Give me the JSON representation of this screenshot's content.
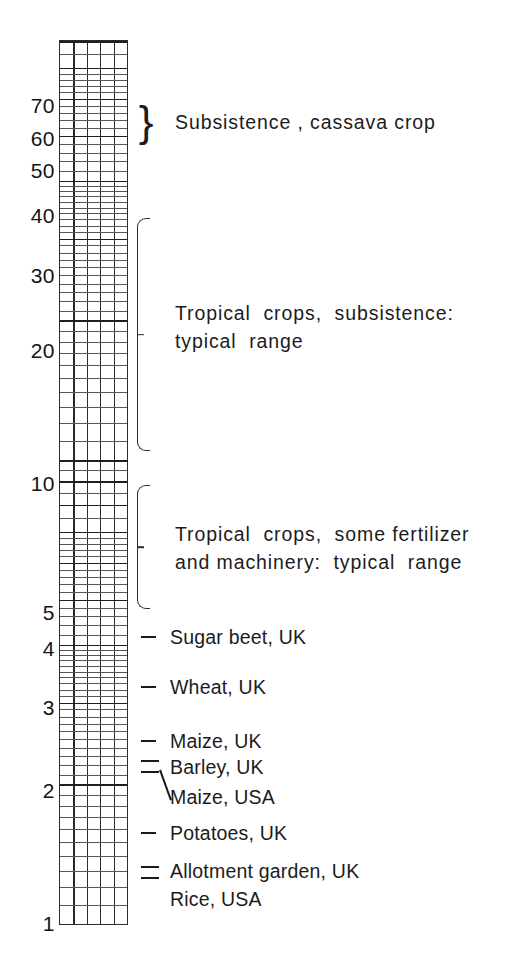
{
  "chart_data": {
    "type": "bar",
    "title": "",
    "subtitle": "",
    "xlabel": "",
    "ylabel": "",
    "scale": "log10",
    "ylim": [
      1,
      80
    ],
    "grid": true,
    "legend_position": "right",
    "axis": {
      "tick_labels": [
        "70",
        "60",
        "50",
        "40",
        "30",
        "20",
        "10",
        "5",
        "4",
        "3",
        "2",
        "1"
      ],
      "tick_values": [
        70,
        60,
        50,
        40,
        30,
        20,
        10,
        5,
        4,
        3,
        2,
        1
      ]
    },
    "ranges": [
      {
        "label": "Subsistence , cassava crop",
        "low": 55,
        "high": 72,
        "marker": "curly-brace"
      },
      {
        "label": "Tropical crops, subsistence: typical range",
        "low": 14,
        "high": 38,
        "marker": "bracket"
      },
      {
        "label": "Tropical crops, some fertilizer and machinery: typical range",
        "low": 5,
        "high": 10,
        "marker": "bracket"
      }
    ],
    "points": [
      {
        "label": "Sugar beet, UK",
        "value": 4.5
      },
      {
        "label": "Wheat, UK",
        "value": 3.4
      },
      {
        "label": "Maize, UK",
        "value": 2.75
      },
      {
        "label": "Barley, UK",
        "value": 2.5
      },
      {
        "label": "Maize, USA",
        "value": 2.4
      },
      {
        "label": "Potatoes, UK",
        "value": 1.8
      },
      {
        "label": "Allotment garden, UK",
        "value": 1.5
      },
      {
        "label": "Rice, USA",
        "value": 1.45
      }
    ]
  },
  "axis": {
    "ticks": [
      {
        "text": "70"
      },
      {
        "text": "60"
      },
      {
        "text": "50"
      },
      {
        "text": "40"
      },
      {
        "text": "30"
      },
      {
        "text": "20"
      },
      {
        "text": "10"
      },
      {
        "text": "5"
      },
      {
        "text": "4"
      },
      {
        "text": "3"
      },
      {
        "text": "2"
      },
      {
        "text": "1"
      }
    ]
  },
  "annotations": {
    "cassava": {
      "brace": "}",
      "text": "Subsistence , cassava crop"
    },
    "subsistence": {
      "line1": "Tropical  crops,  subsistence:",
      "line2": "typical  range"
    },
    "fertilizer": {
      "line1": "Tropical  crops,  some fertilizer",
      "line2": "and machinery:  typical  range"
    },
    "crops": [
      {
        "text": "Sugar beet, UK"
      },
      {
        "text": "Wheat, UK"
      },
      {
        "text": "Maize, UK"
      },
      {
        "text": "Barley, UK"
      },
      {
        "text": "Maize, USA"
      },
      {
        "text": "Potatoes, UK"
      },
      {
        "text": "Allotment garden, UK"
      },
      {
        "text": "Rice, USA"
      }
    ]
  },
  "colors": {
    "ink": "#1c1c1c",
    "grid": "#3a3a3a",
    "grid_minor": "#565656",
    "background": "#ffffff"
  }
}
